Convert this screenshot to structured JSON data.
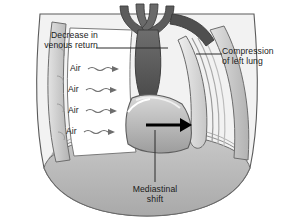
{
  "figure": {
    "background_color": "#ffffff"
  },
  "labels": {
    "venous_return": "Decrease in\nvenous return",
    "compression": "Compression\nof left lung",
    "mediastinal_shift": "Mediastinal\nshift"
  },
  "air_labels": [
    {
      "text": "Air"
    },
    {
      "text": "Air"
    },
    {
      "text": "Air"
    },
    {
      "text": "Air"
    }
  ],
  "colors": {
    "outline": "#4a4a4a",
    "text": "#1a1a1a",
    "leader_line": "#2b2b2b",
    "trachea_dark": "#565656",
    "heart_dark": "#5e5e5e",
    "lung_light": "#e6e6e6",
    "pleura_mid": "#b5b5b5",
    "chest_wall": "#cfcfcf",
    "diaphragm": "#bdbdbd",
    "air_space": "#ffffff",
    "arrow": "#000000"
  },
  "annotations": {
    "shift_arrow_direction": "right",
    "air_flow_direction": "right"
  }
}
